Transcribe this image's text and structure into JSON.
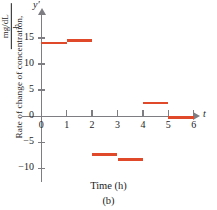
{
  "chart_data": {
    "type": "bar",
    "title": "",
    "subtitle": "",
    "caption": "(b)",
    "xlabel": "Time (h)",
    "ylabel": "Rate of change of concentration,",
    "ylabel_units_numerator": "mg/dL",
    "ylabel_units_denominator": "h",
    "y_axis_symbol": "y′",
    "x_axis_symbol": "t",
    "xlim": [
      0,
      6.6
    ],
    "ylim": [
      -12,
      16.5
    ],
    "x_ticks": [
      0,
      1,
      2,
      3,
      4,
      5,
      6
    ],
    "x_tick_labels": [
      "0",
      "1",
      "2",
      "3",
      "4",
      "5",
      "6"
    ],
    "y_ticks": [
      15,
      10,
      5,
      0,
      -5,
      -10
    ],
    "y_tick_labels": [
      "15",
      "10",
      "5",
      "0",
      "−5",
      "−10"
    ],
    "grid": false,
    "legend": false,
    "style": "step-function / horizontal segments",
    "series_color": "#e0492a",
    "axis_color": "#7d7d82",
    "intervals": [
      {
        "x_start": 0,
        "x_end": 1,
        "value": 14.0
      },
      {
        "x_start": 1,
        "x_end": 2,
        "value": 14.5
      },
      {
        "x_start": 2,
        "x_end": 3,
        "value": -7.3
      },
      {
        "x_start": 3,
        "x_end": 4,
        "value": -8.3
      },
      {
        "x_start": 4,
        "x_end": 5,
        "value": 2.5
      },
      {
        "x_start": 5,
        "x_end": 6,
        "value": -0.2
      }
    ],
    "categories": [
      "0-1",
      "1-2",
      "2-3",
      "3-4",
      "4-5",
      "5-6"
    ],
    "values": [
      14.0,
      14.5,
      -7.3,
      -8.3,
      2.5,
      -0.2
    ]
  }
}
